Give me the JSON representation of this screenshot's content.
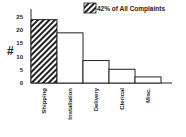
{
  "chart_data": {
    "type": "bar",
    "title": "",
    "xlabel": "",
    "ylabel": "#",
    "ylim": [
      0,
      25
    ],
    "yticks": [
      0,
      5,
      10,
      15,
      20,
      25
    ],
    "categories": [
      "Shipping",
      "Installation",
      "Delivery",
      "Clerical",
      "Misc."
    ],
    "values": [
      24,
      19,
      8.5,
      5.2,
      2.3
    ],
    "highlighted": [
      "Shipping"
    ],
    "legend": [
      {
        "label": "42% of All Complaints",
        "pattern": "diagonal-hatch"
      }
    ],
    "grid": false,
    "legend_position": "top-right"
  },
  "colors": {
    "ink": "#222222",
    "bar_fill": "#ffffff",
    "background": "#ffffff"
  }
}
